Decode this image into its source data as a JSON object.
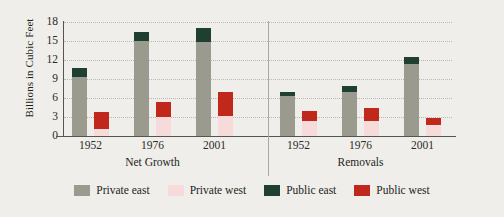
{
  "chart_data": {
    "type": "bar",
    "title": "",
    "xlabel": "",
    "ylabel": "Billions in Cubic Feet",
    "ylim": [
      0,
      18
    ],
    "yticks": [
      0,
      3,
      6,
      9,
      12,
      15,
      18
    ],
    "grid": true,
    "legend_position": "bottom",
    "stacked": true,
    "panels": [
      {
        "name": "Net Growth",
        "categories": [
          "1952",
          "1976",
          "2001"
        ],
        "groups": [
          {
            "category": "1952",
            "bars": [
              {
                "region": "east",
                "segments": [
                  {
                    "series": "Private east",
                    "value": 9.3
                  },
                  {
                    "series": "Public east",
                    "value": 1.4
                  }
                ],
                "total": 10.7
              },
              {
                "region": "west",
                "segments": [
                  {
                    "series": "Private west",
                    "value": 1.1
                  },
                  {
                    "series": "Public west",
                    "value": 2.7
                  }
                ],
                "total": 3.8
              }
            ]
          },
          {
            "category": "1976",
            "bars": [
              {
                "region": "east",
                "segments": [
                  {
                    "series": "Private east",
                    "value": 15.0
                  },
                  {
                    "series": "Public east",
                    "value": 1.5
                  }
                ],
                "total": 16.5
              },
              {
                "region": "west",
                "segments": [
                  {
                    "series": "Private west",
                    "value": 3.0
                  },
                  {
                    "series": "Public west",
                    "value": 2.4
                  }
                ],
                "total": 5.4
              }
            ]
          },
          {
            "category": "2001",
            "bars": [
              {
                "region": "east",
                "segments": [
                  {
                    "series": "Private east",
                    "value": 14.8
                  },
                  {
                    "series": "Public east",
                    "value": 2.2
                  }
                ],
                "total": 17.0
              },
              {
                "region": "west",
                "segments": [
                  {
                    "series": "Private west",
                    "value": 3.1
                  },
                  {
                    "series": "Public west",
                    "value": 3.9
                  }
                ],
                "total": 7.0
              }
            ]
          }
        ]
      },
      {
        "name": "Removals",
        "categories": [
          "1952",
          "1976",
          "2001"
        ],
        "groups": [
          {
            "category": "1952",
            "bars": [
              {
                "region": "east",
                "segments": [
                  {
                    "series": "Private east",
                    "value": 6.3
                  },
                  {
                    "series": "Public east",
                    "value": 0.7
                  }
                ],
                "total": 7.0
              },
              {
                "region": "west",
                "segments": [
                  {
                    "series": "Private west",
                    "value": 2.3
                  },
                  {
                    "series": "Public west",
                    "value": 1.7
                  }
                ],
                "total": 4.0
              }
            ]
          },
          {
            "category": "1976",
            "bars": [
              {
                "region": "east",
                "segments": [
                  {
                    "series": "Private east",
                    "value": 7.0
                  },
                  {
                    "series": "Public east",
                    "value": 0.9
                  }
                ],
                "total": 7.9
              },
              {
                "region": "west",
                "segments": [
                  {
                    "series": "Private west",
                    "value": 2.3
                  },
                  {
                    "series": "Public west",
                    "value": 2.2
                  }
                ],
                "total": 4.5
              }
            ]
          },
          {
            "category": "2001",
            "bars": [
              {
                "region": "east",
                "segments": [
                  {
                    "series": "Private east",
                    "value": 11.4
                  },
                  {
                    "series": "Public east",
                    "value": 1.1
                  }
                ],
                "total": 12.5
              },
              {
                "region": "west",
                "segments": [
                  {
                    "series": "Private west",
                    "value": 1.7
                  },
                  {
                    "series": "Public west",
                    "value": 1.1
                  }
                ],
                "total": 2.8
              }
            ]
          }
        ]
      }
    ],
    "legend": [
      {
        "label": "Private east",
        "color": "#9a9b8e"
      },
      {
        "label": "Private west",
        "color": "#f7dada"
      },
      {
        "label": "Public east",
        "color": "#1f3f30"
      },
      {
        "label": "Public west",
        "color": "#c0281c"
      }
    ]
  }
}
